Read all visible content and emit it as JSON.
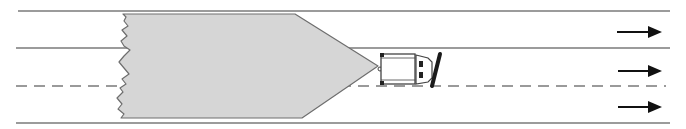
{
  "diagram": {
    "colors": {
      "background": "#ffffff",
      "road_line": "#7a7a7a",
      "snow_fill": "#d6d6d6",
      "snow_outline": "#6e6e6e",
      "vehicle_outline": "#444444",
      "blade": "#1a1a1a",
      "arrow": "#111111"
    },
    "road": {
      "lines": [
        {
          "name": "top-edge",
          "y": 11,
          "style": "solid"
        },
        {
          "name": "lane-divider-1",
          "y": 48,
          "style": "solid"
        },
        {
          "name": "center-line",
          "y": 86,
          "style": "dashed"
        },
        {
          "name": "bottom-edge",
          "y": 123,
          "style": "solid"
        }
      ]
    },
    "snow_mass": {
      "shape": "pentagon-arrow",
      "left_edge": "jagged",
      "tip_x": 378,
      "tip_y": 66
    },
    "vehicle": {
      "type": "snowplow",
      "position": "right lane, at the point of the snow mass",
      "blade_angle": "angled"
    },
    "arrows": [
      {
        "lane": 1,
        "direction": "right"
      },
      {
        "lane": 2,
        "direction": "right"
      },
      {
        "lane": 3,
        "direction": "right"
      }
    ]
  }
}
